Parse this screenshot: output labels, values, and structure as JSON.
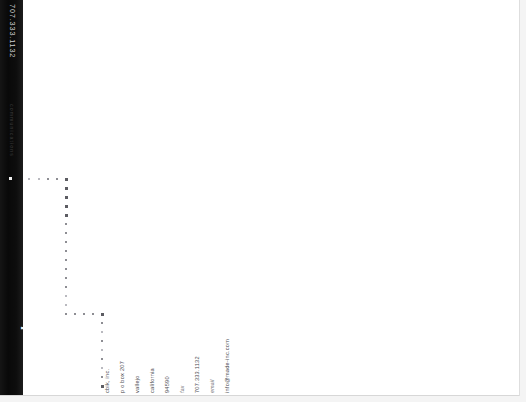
{
  "document": {
    "kind": "scanned-letterhead",
    "orientation": "rotated-90-ccw",
    "page_background": "#ffffff",
    "canvas_background": "#f4f4f4"
  },
  "brand_band": {
    "background": "#0a0a0a",
    "phone": "707.333.1132",
    "tagline": "communications",
    "logo": "cbs",
    "dot_marker": "▪"
  },
  "contact": {
    "lines": [
      {
        "text": "cbik, inc.",
        "style": "normal"
      },
      {
        "text": "p o box 207",
        "style": "normal"
      },
      {
        "text": "vallejo",
        "style": "normal"
      },
      {
        "text": "california",
        "style": "normal"
      },
      {
        "text": "94590",
        "style": "normal"
      },
      {
        "text": "fax",
        "style": "italic"
      },
      {
        "text": "707.333.1132",
        "style": "normal"
      },
      {
        "text": "email",
        "style": "italic"
      },
      {
        "text": "info@made-inc.com",
        "style": "normal"
      }
    ]
  },
  "decoration": {
    "name": "dotted-bracket",
    "dot_color": "#8d8d93",
    "dot_color_faint": "#b9b9bf",
    "dot_color_strong": "#5c5c62",
    "top_row": [
      {
        "x": 28,
        "y": 178,
        "tone": "faint"
      },
      {
        "x": 38,
        "y": 178,
        "tone": "faint"
      },
      {
        "x": 47,
        "y": 178,
        "tone": "normal"
      },
      {
        "x": 56,
        "y": 178,
        "tone": "normal"
      },
      {
        "x": 65,
        "y": 178,
        "tone": "strong"
      }
    ],
    "column": [
      {
        "x": 65,
        "y": 187,
        "tone": "strong"
      },
      {
        "x": 65,
        "y": 196,
        "tone": "strong"
      },
      {
        "x": 65,
        "y": 205,
        "tone": "strong"
      },
      {
        "x": 65,
        "y": 214,
        "tone": "strong"
      },
      {
        "x": 65,
        "y": 223,
        "tone": "normal"
      },
      {
        "x": 65,
        "y": 232,
        "tone": "normal"
      },
      {
        "x": 65,
        "y": 241,
        "tone": "normal"
      },
      {
        "x": 65,
        "y": 250,
        "tone": "normal"
      },
      {
        "x": 65,
        "y": 259,
        "tone": "normal"
      },
      {
        "x": 65,
        "y": 268,
        "tone": "normal"
      },
      {
        "x": 65,
        "y": 277,
        "tone": "normal"
      },
      {
        "x": 65,
        "y": 286,
        "tone": "normal"
      },
      {
        "x": 65,
        "y": 295,
        "tone": "faint"
      },
      {
        "x": 65,
        "y": 304,
        "tone": "faint"
      },
      {
        "x": 65,
        "y": 313,
        "tone": "normal"
      }
    ],
    "bottom_row": [
      {
        "x": 74,
        "y": 313,
        "tone": "normal"
      },
      {
        "x": 83,
        "y": 313,
        "tone": "normal"
      },
      {
        "x": 92,
        "y": 313,
        "tone": "normal"
      },
      {
        "x": 101,
        "y": 313,
        "tone": "strong"
      }
    ],
    "tail_column": [
      {
        "x": 101,
        "y": 322,
        "tone": "normal"
      },
      {
        "x": 101,
        "y": 331,
        "tone": "faint"
      },
      {
        "x": 101,
        "y": 340,
        "tone": "normal"
      },
      {
        "x": 101,
        "y": 349,
        "tone": "faint"
      },
      {
        "x": 101,
        "y": 358,
        "tone": "normal"
      },
      {
        "x": 101,
        "y": 367,
        "tone": "faint"
      },
      {
        "x": 101,
        "y": 376,
        "tone": "normal"
      },
      {
        "x": 101,
        "y": 385,
        "tone": "strong"
      }
    ]
  }
}
